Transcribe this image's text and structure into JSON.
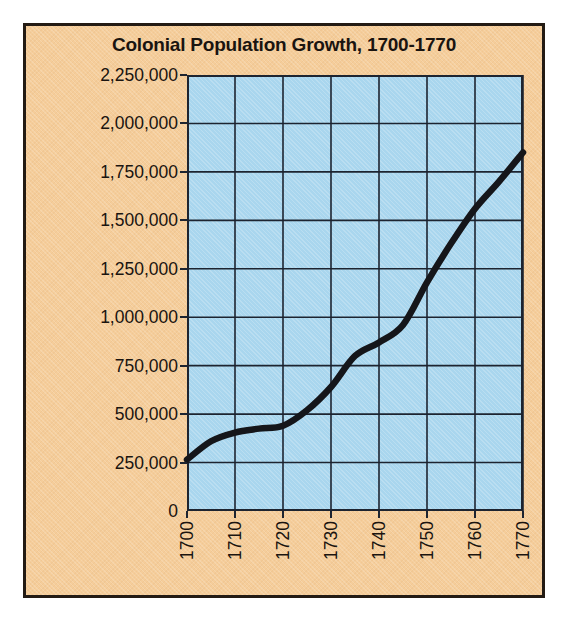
{
  "figure": {
    "title": "Colonial Population Growth, 1700-1770",
    "background_color": "#f5cd9a",
    "border_color": "#231b14",
    "plot_background_color": "#a9d6ee",
    "grid_color": "#1d2430",
    "line_color": "#15161a"
  },
  "chart_data": {
    "type": "line",
    "title": "Colonial Population Growth, 1700-1770",
    "xlabel": "",
    "ylabel": "",
    "grid": true,
    "legend": "none",
    "xlim": [
      1700,
      1770
    ],
    "ylim": [
      0,
      2250000
    ],
    "x_tick_labels": [
      "1700",
      "1710",
      "1720",
      "1730",
      "1740",
      "1750",
      "1760",
      "1770"
    ],
    "x_ticks": [
      1700,
      1710,
      1720,
      1730,
      1740,
      1750,
      1760,
      1770
    ],
    "y_tick_labels": [
      "2,250,000",
      "2,000,000",
      "1,750,000",
      "1,500,000",
      "1,250,000",
      "1,000,000",
      "750,000",
      "500,000",
      "250,000",
      "0"
    ],
    "y_ticks": [
      2250000,
      2000000,
      1750000,
      1500000,
      1250000,
      1000000,
      750000,
      500000,
      250000,
      0
    ],
    "series": [
      {
        "name": "Colonial Population",
        "x": [
          1700,
          1705,
          1710,
          1715,
          1720,
          1725,
          1730,
          1735,
          1740,
          1745,
          1750,
          1755,
          1760,
          1765,
          1770
        ],
        "values": [
          265000,
          360000,
          405000,
          425000,
          440000,
          520000,
          640000,
          800000,
          870000,
          960000,
          1180000,
          1380000,
          1560000,
          1700000,
          1850000
        ]
      }
    ]
  }
}
